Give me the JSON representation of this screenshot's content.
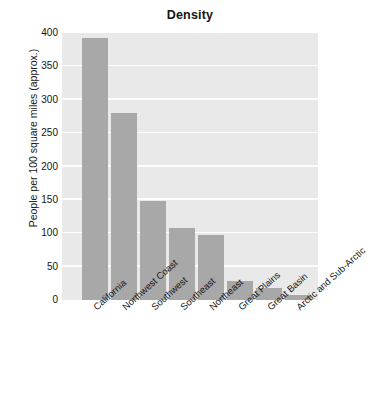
{
  "chart_data": {
    "type": "bar",
    "title": "Density",
    "xlabel": "",
    "ylabel": "People per 100 square miles (approx.)",
    "categories": [
      "California",
      "Northwest Coast",
      "Southwest",
      "Southeast",
      "Northeast",
      "Great Plains",
      "Great Basin",
      "Arctic and Sub-Arctic"
    ],
    "values": [
      392,
      280,
      148,
      108,
      97,
      29,
      18,
      7
    ],
    "ylim": [
      0,
      400
    ],
    "yticks": [
      0,
      50,
      100,
      150,
      200,
      250,
      300,
      350,
      400
    ],
    "ytick_labels": [
      "0",
      "50",
      "100",
      "150",
      "200",
      "250",
      "300",
      "350",
      "400"
    ],
    "grid": true,
    "grid_axis": "y",
    "legend": false,
    "bar_color": "#a8a8a8",
    "plot_background": "#e9e9e9",
    "gridline_color": "#fdfdfd",
    "figure_background": "#ffffff"
  }
}
